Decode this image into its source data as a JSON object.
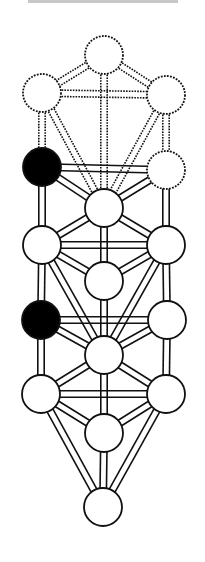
{
  "figure": {
    "title_clipped": true,
    "colors": {
      "stroke": "#111111",
      "node_fill": "#ffffff",
      "filled_node": "#000000",
      "background": "#ffffff"
    },
    "node_radius": 19,
    "nodes": [
      {
        "id": "n1",
        "cx": 104,
        "cy": 55,
        "style": "dashed",
        "fill": "white"
      },
      {
        "id": "n2",
        "cx": 42,
        "cy": 93,
        "style": "dashed",
        "fill": "white"
      },
      {
        "id": "n3",
        "cx": 166,
        "cy": 95,
        "style": "dashed",
        "fill": "white"
      },
      {
        "id": "n4",
        "cx": 42,
        "cy": 167,
        "style": "solid",
        "fill": "black"
      },
      {
        "id": "n5",
        "cx": 166,
        "cy": 170,
        "style": "dashed",
        "fill": "white"
      },
      {
        "id": "n6",
        "cx": 104,
        "cy": 208,
        "style": "solid",
        "fill": "white"
      },
      {
        "id": "n7",
        "cx": 42,
        "cy": 245,
        "style": "solid",
        "fill": "white"
      },
      {
        "id": "n8",
        "cx": 166,
        "cy": 245,
        "style": "solid",
        "fill": "white"
      },
      {
        "id": "n9",
        "cx": 104,
        "cy": 281,
        "style": "solid",
        "fill": "white"
      },
      {
        "id": "n10",
        "cx": 41,
        "cy": 320,
        "style": "solid",
        "fill": "black"
      },
      {
        "id": "n11",
        "cx": 167,
        "cy": 320,
        "style": "solid",
        "fill": "white"
      },
      {
        "id": "n12",
        "cx": 104,
        "cy": 355,
        "style": "solid",
        "fill": "white"
      },
      {
        "id": "n13",
        "cx": 41,
        "cy": 394,
        "style": "solid",
        "fill": "white"
      },
      {
        "id": "n14",
        "cx": 166,
        "cy": 394,
        "style": "solid",
        "fill": "white"
      },
      {
        "id": "n15",
        "cx": 104,
        "cy": 433,
        "style": "solid",
        "fill": "white"
      },
      {
        "id": "n16",
        "cx": 103,
        "cy": 507,
        "style": "solid",
        "fill": "white"
      }
    ],
    "paths": [
      {
        "a": "n1",
        "b": "n2",
        "style": "dashed"
      },
      {
        "a": "n1",
        "b": "n3",
        "style": "dashed"
      },
      {
        "a": "n1",
        "b": "n6",
        "style": "dashed"
      },
      {
        "a": "n2",
        "b": "n3",
        "style": "dashed"
      },
      {
        "a": "n2",
        "b": "n4",
        "style": "dashed"
      },
      {
        "a": "n2",
        "b": "n6",
        "style": "dashed"
      },
      {
        "a": "n3",
        "b": "n5",
        "style": "dashed"
      },
      {
        "a": "n3",
        "b": "n6",
        "style": "dashed"
      },
      {
        "a": "n4",
        "b": "n5",
        "style": "solid"
      },
      {
        "a": "n4",
        "b": "n6",
        "style": "solid"
      },
      {
        "a": "n5",
        "b": "n6",
        "style": "solid"
      },
      {
        "a": "n4",
        "b": "n7",
        "style": "solid"
      },
      {
        "a": "n5",
        "b": "n8",
        "style": "solid"
      },
      {
        "a": "n6",
        "b": "n7",
        "style": "solid"
      },
      {
        "a": "n6",
        "b": "n8",
        "style": "solid"
      },
      {
        "a": "n6",
        "b": "n9",
        "style": "solid"
      },
      {
        "a": "n7",
        "b": "n8",
        "style": "solid"
      },
      {
        "a": "n7",
        "b": "n9",
        "style": "solid"
      },
      {
        "a": "n8",
        "b": "n9",
        "style": "solid"
      },
      {
        "a": "n7",
        "b": "n10",
        "style": "solid"
      },
      {
        "a": "n8",
        "b": "n11",
        "style": "solid"
      },
      {
        "a": "n7",
        "b": "n12",
        "style": "solid"
      },
      {
        "a": "n8",
        "b": "n12",
        "style": "solid"
      },
      {
        "a": "n9",
        "b": "n12",
        "style": "solid"
      },
      {
        "a": "n10",
        "b": "n11",
        "style": "solid"
      },
      {
        "a": "n10",
        "b": "n12",
        "style": "solid"
      },
      {
        "a": "n11",
        "b": "n12",
        "style": "solid"
      },
      {
        "a": "n10",
        "b": "n13",
        "style": "solid"
      },
      {
        "a": "n11",
        "b": "n14",
        "style": "solid"
      },
      {
        "a": "n12",
        "b": "n13",
        "style": "solid"
      },
      {
        "a": "n12",
        "b": "n14",
        "style": "solid"
      },
      {
        "a": "n12",
        "b": "n15",
        "style": "solid"
      },
      {
        "a": "n13",
        "b": "n14",
        "style": "solid"
      },
      {
        "a": "n13",
        "b": "n15",
        "style": "solid"
      },
      {
        "a": "n14",
        "b": "n15",
        "style": "solid"
      },
      {
        "a": "n13",
        "b": "n16",
        "style": "solid"
      },
      {
        "a": "n14",
        "b": "n16",
        "style": "solid"
      },
      {
        "a": "n15",
        "b": "n16",
        "style": "solid"
      }
    ]
  }
}
